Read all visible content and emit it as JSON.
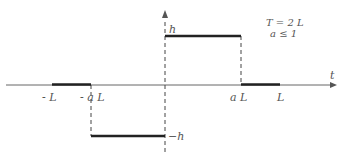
{
  "diagram": {
    "title_annotation": {
      "line1": "T = 2 L",
      "line2": "a ≤ 1"
    },
    "axes": {
      "x_label": "t"
    },
    "x_ticks": [
      {
        "label": "- L"
      },
      {
        "label": "- a L"
      },
      {
        "label": "a L"
      },
      {
        "label": "L"
      }
    ],
    "y_levels": {
      "top": "h",
      "bottom": "−h"
    },
    "colors": {
      "axis": "#555555",
      "signal": "#222222",
      "dashed": "#444444",
      "text": "#555555"
    }
  }
}
